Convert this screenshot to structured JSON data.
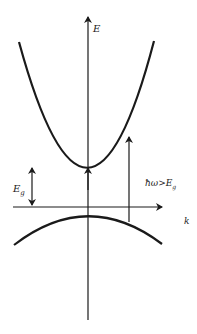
{
  "diagram": {
    "type": "band-structure",
    "axes": {
      "y_label": "E",
      "x_label": "k"
    },
    "bands": [
      {
        "name": "conduction band",
        "shape": "upward parabola",
        "minimum_at_k": 0
      },
      {
        "name": "valence band",
        "shape": "downward parabola",
        "maximum_at_k": 0
      }
    ],
    "annotations": {
      "gap_label_main": "E",
      "gap_label_sub": "g",
      "transition_label_main": "ħω>E",
      "transition_label_sub": "g"
    },
    "colors": {
      "stroke": "#1a1a1a",
      "background": "#ffffff"
    }
  }
}
